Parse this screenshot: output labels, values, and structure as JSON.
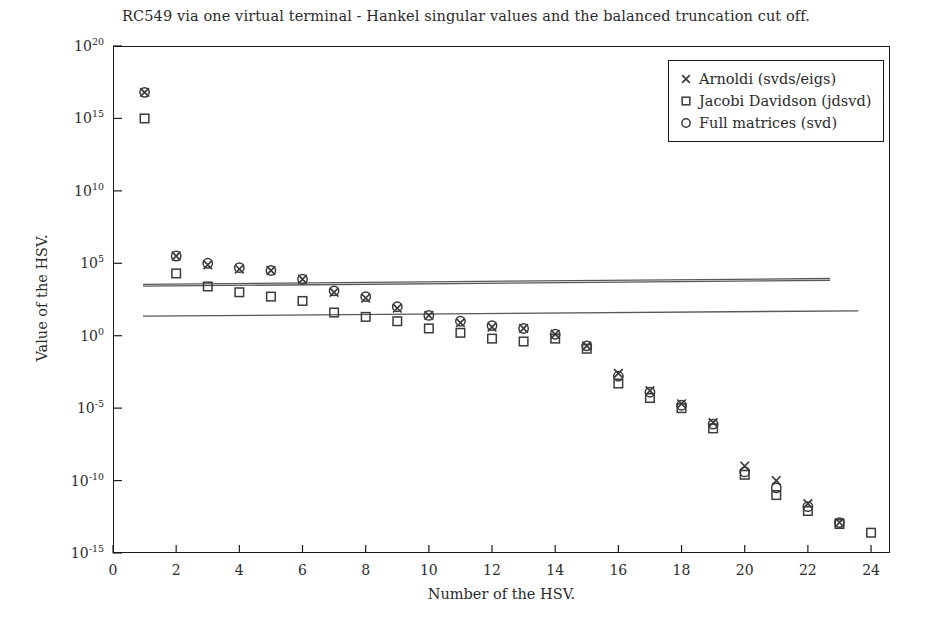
{
  "chart_data": {
    "type": "scatter",
    "title": "RC549 via one virtual terminal - Hankel singular values and the balanced truncation cut off.",
    "xlabel": "Number of the HSV.",
    "ylabel": "Value of the HSV.",
    "xlim": [
      0,
      24.6
    ],
    "ylim": [
      -15,
      20
    ],
    "yscale": "log",
    "xticks": [
      0,
      2,
      4,
      6,
      8,
      10,
      12,
      14,
      16,
      18,
      20,
      22,
      24
    ],
    "xtick_labels": [
      "0",
      "2",
      "4",
      "6",
      "8",
      "10",
      "12",
      "14",
      "16",
      "18",
      "20",
      "22",
      "24"
    ],
    "yticks": [
      -15,
      -10,
      -5,
      0,
      5,
      10,
      15,
      20
    ],
    "ytick_labels": [
      "10-15",
      "10-10",
      "10-5",
      "100",
      "105",
      "1010",
      "1015",
      "1020"
    ],
    "ytick_mantissa": "10",
    "ytick_exponents": [
      "-15",
      "-10",
      "-5",
      "0",
      "5",
      "10",
      "15",
      "20"
    ],
    "grid": false,
    "legend_position": "top-right",
    "x": [
      1,
      2,
      3,
      4,
      5,
      6,
      7,
      8,
      9,
      10,
      11,
      12,
      13,
      14,
      15,
      16,
      17,
      18,
      19,
      20,
      21,
      22,
      23,
      24
    ],
    "series": [
      {
        "name": "Arnoldi (svds/eigs)",
        "marker": "x",
        "color": "#3a3a3a",
        "log_values": [
          16.8,
          5.5,
          4.9,
          4.6,
          4.5,
          3.9,
          3.0,
          2.6,
          1.9,
          1.4,
          0.9,
          0.6,
          0.5,
          0.1,
          -0.7,
          -2.6,
          -3.8,
          -4.7,
          -6.0,
          -9.0,
          -10.0,
          -11.6,
          -12.9,
          null
        ],
        "values": [
          6.3e+16,
          320000.0,
          79000.0,
          40000.0,
          32000.0,
          7900.0,
          1000.0,
          400.0,
          79,
          25,
          7.9,
          4.0,
          3.2,
          1.26,
          0.2,
          0.0025,
          0.00016,
          2e-05,
          1e-06,
          1e-09,
          1e-10,
          2.5e-12,
          1.26e-13,
          null
        ]
      },
      {
        "name": "Jacobi Davidson (jdsvd)",
        "marker": "square",
        "color": "#3a3a3a",
        "log_values": [
          15.0,
          4.3,
          3.4,
          3.0,
          2.7,
          2.4,
          1.6,
          1.3,
          1.0,
          0.5,
          0.2,
          -0.2,
          -0.4,
          -0.2,
          -0.9,
          -3.3,
          -4.3,
          -5.0,
          -6.4,
          -9.6,
          -11.0,
          -12.1,
          -13.0,
          -13.6
        ],
        "values": [
          1000000000000000.0,
          20000.0,
          2500.0,
          1000.0,
          500.0,
          250.0,
          40,
          20,
          10,
          3.2,
          1.6,
          0.63,
          0.4,
          0.63,
          0.126,
          0.0005,
          5e-05,
          1e-05,
          4e-07,
          2.5e-10,
          1e-11,
          7.9e-13,
          1e-13,
          2.5e-14
        ]
      },
      {
        "name": "Full matrices (svd)",
        "marker": "circle",
        "color": "#3a3a3a",
        "log_values": [
          16.8,
          5.5,
          5.0,
          4.7,
          4.5,
          3.9,
          3.1,
          2.7,
          2.0,
          1.4,
          1.0,
          0.7,
          0.5,
          0.1,
          -0.7,
          -2.8,
          -3.9,
          -4.8,
          -6.1,
          -9.4,
          -10.5,
          -11.8,
          -12.9,
          null
        ],
        "values": [
          6.3e+16,
          320000.0,
          100000.0,
          50000.0,
          32000.0,
          7900.0,
          1260.0,
          500.0,
          100.0,
          25,
          10,
          5.0,
          3.2,
          1.26,
          0.2,
          0.0016,
          0.000126,
          1.6e-05,
          7.9e-07,
          4e-10,
          3.2e-11,
          1.6e-12,
          1.26e-13,
          null
        ]
      }
    ],
    "cutoff_lines": [
      {
        "name": "upper-cutoff-line-a",
        "x0": 0.95,
        "y0": 3.55,
        "x1": 22.7,
        "y1": 3.95
      },
      {
        "name": "upper-cutoff-line-b",
        "x0": 0.95,
        "y0": 3.42,
        "x1": 22.7,
        "y1": 3.82
      },
      {
        "name": "lower-cutoff-line",
        "x0": 0.95,
        "y0": 1.35,
        "x1": 23.6,
        "y1": 1.72
      }
    ]
  },
  "legend": {
    "items": [
      {
        "label": "Arnoldi (svds/eigs)",
        "marker": "x"
      },
      {
        "label": "Jacobi Davidson (jdsvd)",
        "marker": "square"
      },
      {
        "label": "Full matrices (svd)",
        "marker": "circle"
      }
    ]
  }
}
